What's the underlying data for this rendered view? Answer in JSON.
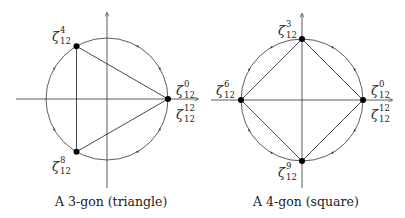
{
  "diagrams": [
    {
      "caption": "A 3-gon (triangle)",
      "center": [
        107,
        99
      ],
      "radius": 61,
      "vertices": [
        {
          "label_base": "ζ",
          "label_sup": "0",
          "label_sub": "12",
          "alt_sup": "12",
          "alt_sub": "12",
          "angle_deg": 0
        },
        {
          "label_base": "ζ",
          "label_sup": "4",
          "label_sub": "12",
          "angle_deg": 120
        },
        {
          "label_base": "ζ",
          "label_sup": "8",
          "label_sub": "12",
          "angle_deg": 240
        }
      ]
    },
    {
      "caption": "A 4-gon (square)",
      "center": [
        302,
        100
      ],
      "radius": 61,
      "vertices": [
        {
          "label_base": "ζ",
          "label_sup": "0",
          "label_sub": "12",
          "alt_sup": "12",
          "alt_sub": "12",
          "angle_deg": 0
        },
        {
          "label_base": "ζ",
          "label_sup": "3",
          "label_sub": "12",
          "angle_deg": 90
        },
        {
          "label_base": "ζ",
          "label_sup": "6",
          "label_sub": "12",
          "angle_deg": 180
        },
        {
          "label_base": "ζ",
          "label_sup": "9",
          "label_sub": "12",
          "angle_deg": 270
        }
      ]
    }
  ],
  "colors": {
    "line": "#333333",
    "point": "#000000",
    "text": "#222222"
  }
}
